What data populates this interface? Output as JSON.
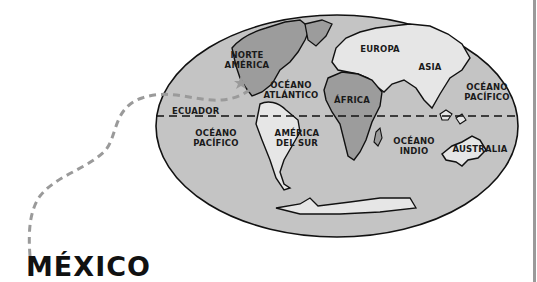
{
  "title": "MÉXICO",
  "colors": {
    "ocean": "#c4c4c4",
    "land_light": "#e6e6e6",
    "land_dark": "#9c9c9c",
    "outline": "#111111",
    "route": "#9a9a9a",
    "rule": "#9a9a9a"
  },
  "map": {
    "labels": {
      "north_america": "NORTE\nAMÉRICA",
      "europe": "EUROPA",
      "asia": "ASIA",
      "atlantic": "OCÉANO\nATLÁNTICO",
      "africa": "ÁFRICA",
      "pacific_east": "OCÉANO\nPACÍFICO",
      "equator": "ECUADOR",
      "pacific_west": "OCÉANO\nPACÍFICO",
      "south_america": "AMÉRICA\nDEL SUR",
      "indian": "OCÉANO\nINDIO",
      "australia": "AUSTRALIA"
    }
  }
}
